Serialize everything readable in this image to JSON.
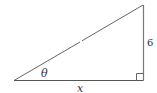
{
  "diagram": {
    "type": "right-triangle",
    "labels": {
      "angle": "θ",
      "adjacent_side": "x",
      "opposite_side": "6"
    },
    "colors": {
      "stroke": "#555555",
      "text": "#333333",
      "background": "#ffffff"
    }
  }
}
